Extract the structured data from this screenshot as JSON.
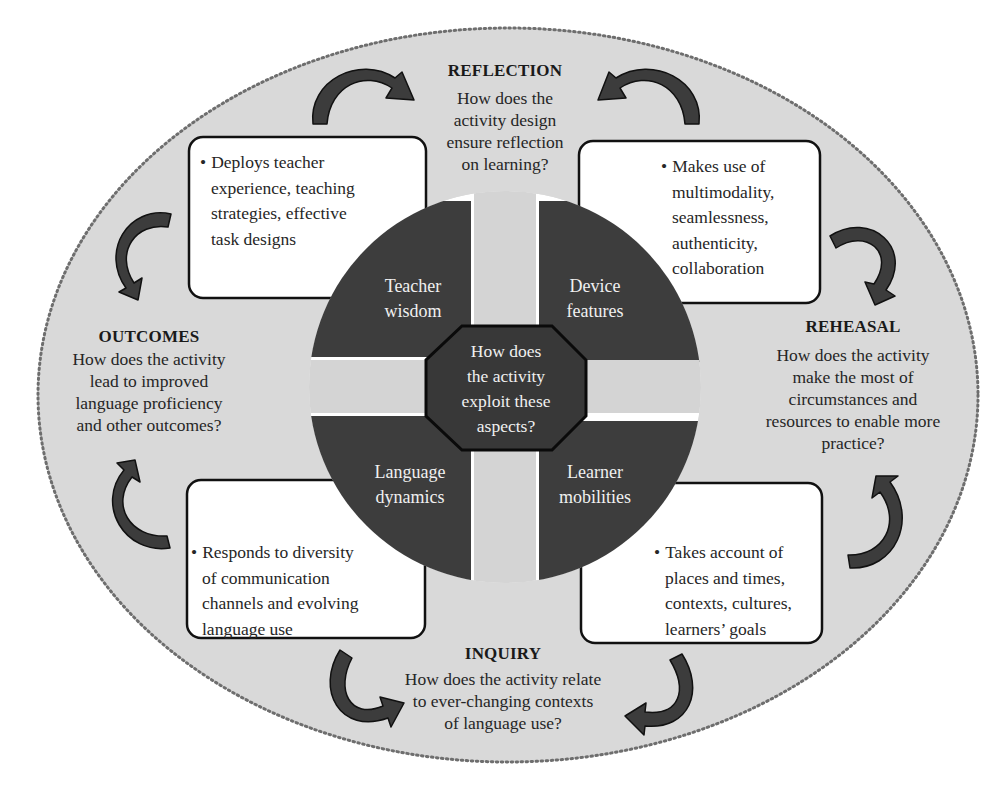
{
  "colors": {
    "ellipse_fill": "#d9d9d9",
    "ellipse_border": "#6e6e6e",
    "quadrant_fill": "#3d3d3d",
    "octagon_fill": "#383838",
    "arrow_fill": "#3c3c3c",
    "box_fill": "#ffffff"
  },
  "stages": {
    "reflection": {
      "title": "REFLECTION",
      "question_lines": [
        "How does the",
        "activity design",
        "ensure reflection",
        "on learning?"
      ]
    },
    "rehearsal": {
      "title": "REHEASAL",
      "question_lines": [
        "How does the activity",
        "make the most of",
        "circumstances and",
        "resources to enable more",
        "practice?"
      ]
    },
    "inquiry": {
      "title": "INQUIRY",
      "question_lines": [
        "How does the activity relate",
        "to ever-changing contexts",
        "of language use?"
      ]
    },
    "outcomes": {
      "title": "OUTCOMES",
      "question_lines": [
        "How does the activity",
        "lead to improved",
        "language proficiency",
        "and other outcomes?"
      ]
    }
  },
  "boxes": {
    "teacher": {
      "bullet": "•",
      "lines": [
        "Deploys teacher",
        "experience, teaching",
        "strategies, effective",
        "task designs"
      ]
    },
    "device": {
      "bullet": "•",
      "lines": [
        "Makes use of",
        "multimodality,",
        "seamlessness,",
        "authenticity,",
        "collaboration"
      ]
    },
    "language": {
      "bullet": "•",
      "lines": [
        "Responds to diversity",
        "of communication",
        "channels and evolving",
        "language use"
      ]
    },
    "learner": {
      "bullet": "•",
      "lines": [
        "Takes account of",
        "places and times,",
        "contexts, cultures,",
        "learners’ goals"
      ]
    }
  },
  "quadrants": {
    "teacher": {
      "lines": [
        "Teacher",
        "wisdom"
      ]
    },
    "device": {
      "lines": [
        "Device",
        "features"
      ]
    },
    "language": {
      "lines": [
        "Language",
        "dynamics"
      ]
    },
    "learner": {
      "lines": [
        "Learner",
        "mobilities"
      ]
    }
  },
  "center": {
    "lines": [
      "How does",
      "the activity",
      "exploit these",
      "aspects?"
    ]
  }
}
